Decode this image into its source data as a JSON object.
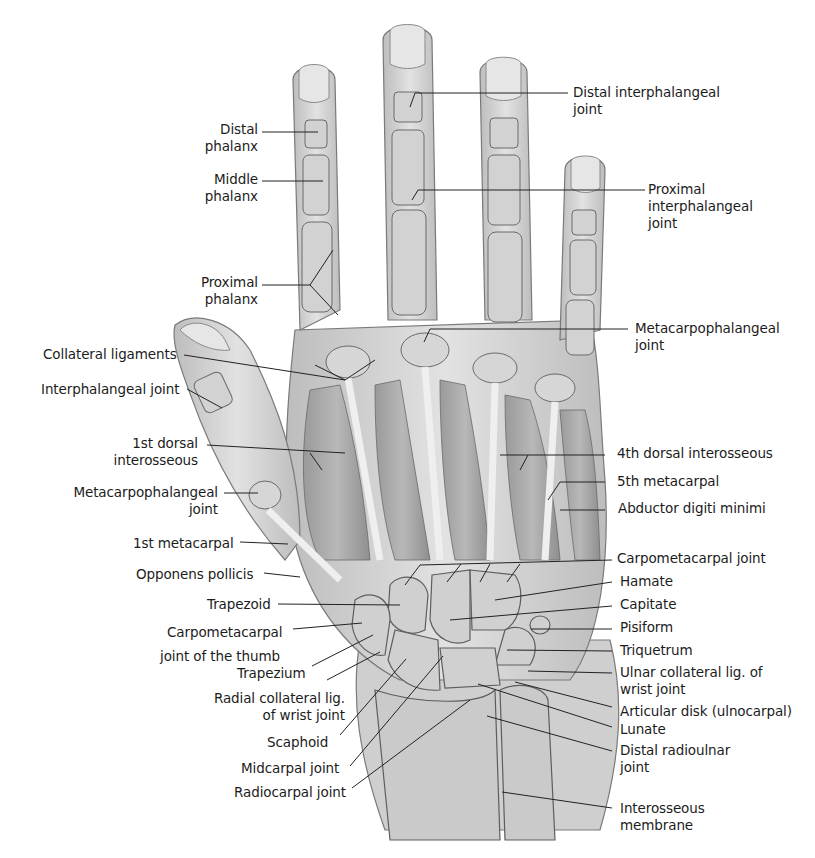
{
  "figure": {
    "colors": {
      "background": "#ffffff",
      "skin": "#d9d9d9",
      "bone": "#c9c9c9",
      "outline": "#6e6e6e",
      "leader": "#222222",
      "text": "#1c1c1c"
    }
  },
  "labels_left": [
    {
      "id": "distal-phalanx",
      "lines": [
        "Distal",
        "phalanx"
      ]
    },
    {
      "id": "middle-phalanx",
      "lines": [
        "Middle",
        "phalanx"
      ]
    },
    {
      "id": "proximal-phalanx",
      "lines": [
        "Proximal",
        "phalanx"
      ]
    },
    {
      "id": "collateral-ligaments",
      "lines": [
        "Collateral ligaments"
      ]
    },
    {
      "id": "interphalangeal-joint",
      "lines": [
        "Interphalangeal joint"
      ]
    },
    {
      "id": "1st-dorsal-interosseous",
      "lines": [
        "1st dorsal",
        "interosseous"
      ]
    },
    {
      "id": "metacarpophalangeal-joint-thumb",
      "lines": [
        "Metacarpophalangeal",
        "joint"
      ]
    },
    {
      "id": "1st-metacarpal",
      "lines": [
        "1st metacarpal"
      ]
    },
    {
      "id": "opponens-pollicis",
      "lines": [
        "Opponens pollicis"
      ]
    },
    {
      "id": "trapezoid",
      "lines": [
        "Trapezoid"
      ]
    },
    {
      "id": "carpometacarpal-joint-thumb",
      "lines": [
        "Carpometacarpal",
        "joint of the thumb"
      ]
    },
    {
      "id": "trapezium",
      "lines": [
        "Trapezium"
      ]
    },
    {
      "id": "radial-collateral-lig",
      "lines": [
        "Radial collateral lig.",
        "of wrist joint"
      ]
    },
    {
      "id": "scaphoid",
      "lines": [
        "Scaphoid"
      ]
    },
    {
      "id": "midcarpal-joint",
      "lines": [
        "Midcarpal joint"
      ]
    },
    {
      "id": "radiocarpal-joint",
      "lines": [
        "Radiocarpal joint"
      ]
    }
  ],
  "labels_right": [
    {
      "id": "distal-interphalangeal-joint",
      "lines": [
        "Distal interphalangeal",
        "joint"
      ]
    },
    {
      "id": "proximal-interphalangeal-joint",
      "lines": [
        "Proximal",
        "interphalangeal",
        "joint"
      ]
    },
    {
      "id": "metacarpophalangeal-joint",
      "lines": [
        "Metacarpophalangeal",
        "joint"
      ]
    },
    {
      "id": "4th-dorsal-interosseous",
      "lines": [
        "4th dorsal interosseous"
      ]
    },
    {
      "id": "5th-metacarpal",
      "lines": [
        "5th metacarpal"
      ]
    },
    {
      "id": "abductor-digiti-minimi",
      "lines": [
        "Abductor digiti minimi"
      ]
    },
    {
      "id": "carpometacarpal-joint",
      "lines": [
        "Carpometacarpal joint"
      ]
    },
    {
      "id": "hamate",
      "lines": [
        "Hamate"
      ]
    },
    {
      "id": "capitate",
      "lines": [
        "Capitate"
      ]
    },
    {
      "id": "pisiform",
      "lines": [
        "Pisiform"
      ]
    },
    {
      "id": "triquetrum",
      "lines": [
        "Triquetrum"
      ]
    },
    {
      "id": "ulnar-collateral-lig",
      "lines": [
        "Ulnar collateral lig. of",
        "wrist joint"
      ]
    },
    {
      "id": "articular-disk",
      "lines": [
        "Articular disk (ulnocarpal)"
      ]
    },
    {
      "id": "lunate",
      "lines": [
        "Lunate"
      ]
    },
    {
      "id": "distal-radioulnar-joint",
      "lines": [
        "Distal radioulnar",
        "joint"
      ]
    },
    {
      "id": "interosseous-membrane",
      "lines": [
        "Interosseous",
        "membrane"
      ]
    }
  ]
}
